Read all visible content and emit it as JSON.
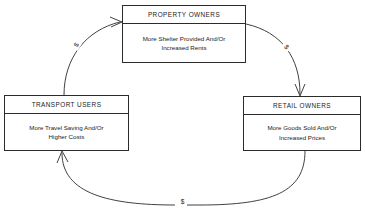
{
  "diagram": {
    "type": "cycle-flow-diagram",
    "line_color": "#2b2b2b",
    "background_color": "#ffffff",
    "nodes": [
      {
        "id": "property-owners",
        "title": "PROPERTY OWNERS",
        "body_line1": "More Shelter Provided And/Or",
        "body_line2": "Increased Rents"
      },
      {
        "id": "transport-users",
        "title": "TRANSPORT USERS",
        "body_line1": "More Travel Saving And/Or",
        "body_line2": "Higher Costs"
      },
      {
        "id": "retail-owners",
        "title": "RETAIL OWNERS",
        "body_line1": "More Goods Sold And/Or",
        "body_line2": "Increased Prices"
      }
    ],
    "connectors": [
      {
        "id": "transport-to-property",
        "from": "transport-users",
        "to": "property-owners",
        "label": "$"
      },
      {
        "id": "property-to-retail",
        "from": "property-owners",
        "to": "retail-owners",
        "label": "$"
      },
      {
        "id": "retail-to-transport",
        "from": "retail-owners",
        "to": "transport-users",
        "label": "$"
      }
    ]
  }
}
